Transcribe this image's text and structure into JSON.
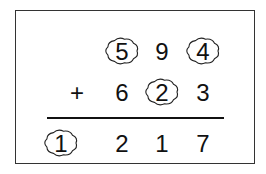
{
  "problem": {
    "operator": "+",
    "row1": {
      "digits": [
        "5",
        "9",
        "4"
      ],
      "covered": [
        true,
        false,
        true
      ]
    },
    "row2": {
      "digits": [
        "6",
        "2",
        "3"
      ],
      "covered": [
        false,
        true,
        false
      ]
    },
    "result": {
      "digits": [
        "1",
        "2",
        "1",
        "7"
      ],
      "covered": [
        true,
        false,
        false,
        false
      ]
    }
  }
}
